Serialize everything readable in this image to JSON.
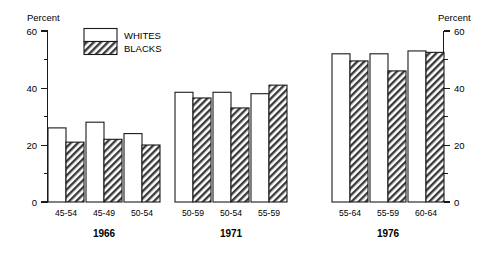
{
  "chart_data": {
    "type": "bar",
    "title": "",
    "xlabel": "",
    "ylabel": "Percent",
    "ylabel_right": "Percent",
    "ylim": [
      0,
      60
    ],
    "yticks": [
      0,
      20,
      40,
      60
    ],
    "ytick_labels": [
      "0",
      "20",
      "40",
      "60"
    ],
    "yminor_ticks": [
      10,
      30,
      50
    ],
    "grid": false,
    "legend_position": "top-left-inside",
    "legend": [
      {
        "name": "WHITES",
        "pattern": "open"
      },
      {
        "name": "BLACKS",
        "pattern": "hatched"
      }
    ],
    "series": [
      {
        "name": "WHITES",
        "values": [
          26,
          28,
          24,
          38.5,
          38.5,
          38,
          52,
          52,
          53
        ]
      },
      {
        "name": "BLACKS",
        "values": [
          21,
          22,
          20,
          36.5,
          33,
          41,
          49.5,
          46,
          52.5
        ]
      }
    ],
    "categories": [
      "45-54",
      "45-49",
      "50-54",
      "50-59",
      "50-54",
      "55-59",
      "55-64",
      "55-59",
      "60-64"
    ],
    "groups": [
      {
        "label": "1966",
        "categories": [
          "45-54",
          "45-49",
          "50-54"
        ]
      },
      {
        "label": "1971",
        "categories": [
          "50-59",
          "50-54",
          "55-59"
        ]
      },
      {
        "label": "1976",
        "categories": [
          "55-64",
          "55-59",
          "60-64"
        ]
      }
    ]
  },
  "colors": {
    "ink": "#1a1a1a",
    "background": "#ffffff",
    "bar_white_fill": "#ffffff",
    "bar_black_fill": "#555555"
  }
}
